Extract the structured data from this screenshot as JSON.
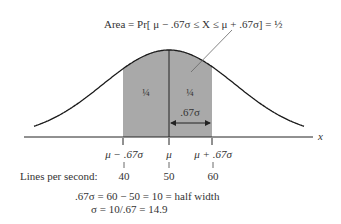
{
  "annotation": {
    "area_label": "Area = Pr[ μ − .67σ ≤ X ≤ μ + .67σ] = ½"
  },
  "regions": {
    "left_quarter": "¼",
    "right_quarter": "¼",
    "half_width_label": ".67σ"
  },
  "axis": {
    "x_label": "x",
    "ticks": [
      {
        "symbol": "μ − .67σ",
        "value": "40"
      },
      {
        "symbol": "μ",
        "value": "50"
      },
      {
        "symbol": "μ + .67σ",
        "value": "60"
      }
    ],
    "row_label": "Lines per second:"
  },
  "equations": {
    "line1": ".67σ  = 60 − 50 = 10 = half width",
    "line2": "σ  = 10/.67 = 14.9"
  },
  "colors": {
    "shade": "#a9a9a9",
    "curve": "#1a1a1a"
  },
  "chart_data": {
    "type": "area",
    "xlabel": "x (Lines per second)",
    "ylabel": "",
    "x_ticks": [
      40,
      50,
      60
    ],
    "x_tick_labels": [
      "μ − .67σ",
      "μ",
      "μ + .67σ"
    ],
    "mean": 50,
    "sigma": 14.9,
    "shaded_interval": [
      40,
      60
    ],
    "shaded_area": 0.5,
    "sub_areas": [
      0.25,
      0.25
    ],
    "annotations": [
      "Area = Pr[μ − .67σ ≤ X ≤ μ + .67σ] = 1/2",
      ".67σ = 60 − 50 = 10 = half width",
      "σ = 10/.67 = 14.9"
    ]
  }
}
